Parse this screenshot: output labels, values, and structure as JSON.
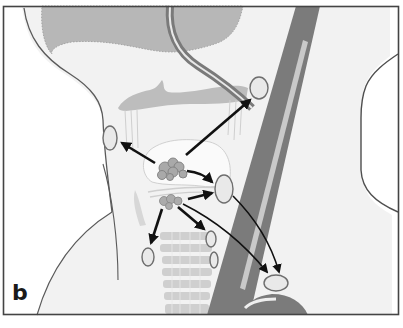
{
  "figure": {
    "panel_label": "b",
    "colors": {
      "background": "#ffffff",
      "tissue_fill": "#f2f2f2",
      "outline": "#5a5a5a",
      "soft_gray": "#b9b9b9",
      "vessel": "#7a7a7a",
      "vessel_highlight": "#c8c8c8",
      "node_fill": "#e9e9e9",
      "node_stroke": "#6e6e6e",
      "primary_fill": "#a8a8a8",
      "arrow": "#111111",
      "frame": "#444444"
    },
    "elements": {
      "primary_sites": [
        "supraglottic-tumor-cluster",
        "glottic-subglottic-tumor-cluster"
      ],
      "lymph_nodes": [
        "upper-jugular-node",
        "prelaryngeal-left-node",
        "mid-jugular-node",
        "paratracheal-node",
        "pretracheal-node-upper",
        "pretracheal-node-lower",
        "lower-jugular-supraclavicular-node"
      ],
      "arrow_count": 9
    }
  }
}
